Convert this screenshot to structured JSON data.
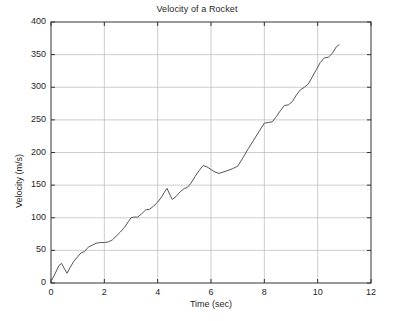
{
  "figure": {
    "title": "Velocity of a Rocket",
    "background_color": "#ffffff",
    "axes_color": "#333333",
    "grid_color": "#b8b8b8",
    "line_color": "#555555"
  },
  "axis": {
    "x_label": "Time (sec)",
    "y_label": "Velocity (m/s)",
    "x_ticks": [
      "0",
      "2",
      "4",
      "6",
      "8",
      "10",
      "12"
    ],
    "y_ticks": [
      "0",
      "50",
      "100",
      "150",
      "200",
      "250",
      "300",
      "350",
      "400"
    ]
  },
  "chart_data": {
    "type": "line",
    "title": "Velocity of a Rocket",
    "xlabel": "Time (sec)",
    "ylabel": "Velocity (m/s)",
    "xlim": [
      0,
      12
    ],
    "ylim": [
      0,
      400
    ],
    "xticks": [
      0,
      2,
      4,
      6,
      8,
      10,
      12
    ],
    "yticks": [
      0,
      50,
      100,
      150,
      200,
      250,
      300,
      350,
      400
    ],
    "grid": true,
    "legend": null,
    "series": [
      {
        "name": "velocity",
        "color": "#555555",
        "x": [
          0.0,
          0.15,
          0.3,
          0.4,
          0.5,
          0.6,
          0.72,
          0.85,
          1.0,
          1.12,
          1.25,
          1.4,
          1.55,
          1.7,
          1.85,
          2.0,
          2.15,
          2.3,
          2.45,
          2.6,
          2.75,
          2.9,
          3.0,
          3.1,
          3.25,
          3.4,
          3.55,
          3.7,
          3.85,
          4.0,
          4.15,
          4.25,
          4.35,
          4.45,
          4.55,
          4.7,
          4.85,
          5.0,
          5.1,
          5.25,
          5.4,
          5.55,
          5.7,
          5.85,
          6.0,
          6.15,
          6.3,
          6.45,
          6.6,
          6.8,
          7.0,
          7.2,
          7.4,
          7.6,
          7.8,
          8.0,
          8.15,
          8.3,
          8.45,
          8.6,
          8.75,
          8.9,
          9.05,
          9.2,
          9.35,
          9.5,
          9.65,
          9.8,
          9.95,
          10.1,
          10.25,
          10.4,
          10.55,
          10.7,
          10.8
        ],
        "y": [
          2,
          14,
          27,
          30,
          22,
          15,
          24,
          33,
          40,
          46,
          48,
          55,
          58,
          61,
          62,
          62,
          63,
          66,
          72,
          78,
          85,
          94,
          100,
          101,
          101,
          106,
          112,
          113,
          118,
          124,
          132,
          139,
          145,
          136,
          128,
          133,
          140,
          145,
          146,
          153,
          163,
          172,
          180,
          178,
          174,
          170,
          168,
          170,
          172,
          175,
          179,
          192,
          206,
          219,
          232,
          245,
          246,
          247,
          255,
          264,
          272,
          273,
          278,
          288,
          296,
          300,
          305,
          316,
          327,
          338,
          345,
          346,
          352,
          362,
          365
        ]
      }
    ]
  }
}
